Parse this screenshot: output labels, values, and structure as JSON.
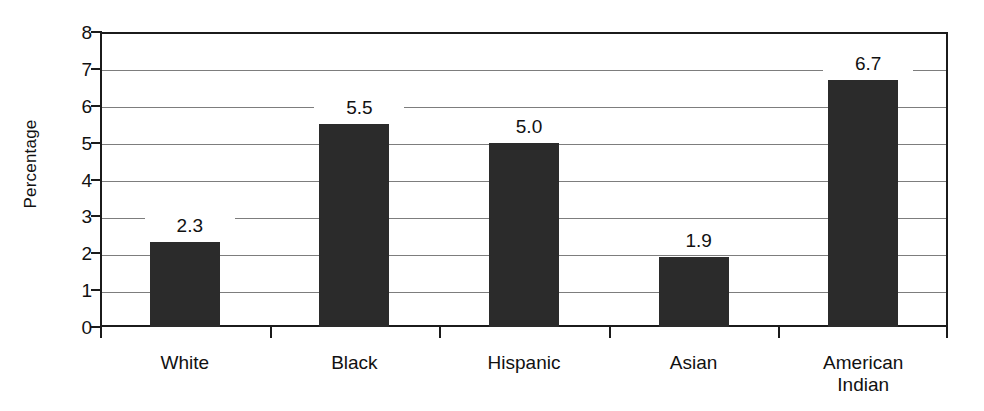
{
  "chart_data": {
    "type": "bar",
    "title": "",
    "xlabel": "",
    "ylabel": "Percentage",
    "categories": [
      "White",
      "Black",
      "Hispanic",
      "Asian",
      "American\nIndian"
    ],
    "values": [
      2.3,
      5.5,
      5.0,
      1.9,
      6.7
    ],
    "value_labels": [
      "2.3",
      "5.5",
      "5.0",
      "1.9",
      "6.7"
    ],
    "ylim": [
      0,
      8
    ],
    "yticks": [
      0,
      1,
      2,
      3,
      4,
      5,
      6,
      7,
      8
    ],
    "ytick_labels": [
      "0",
      "1",
      "2",
      "3",
      "4",
      "5",
      "6",
      "7",
      "8"
    ],
    "grid": true,
    "grid_axis": "y",
    "legend": false,
    "bar_color": "#2b2b2b",
    "grid_color": "#7d7d7d",
    "axis_color": "#1b1b1b",
    "background_color": "#ffffff"
  }
}
